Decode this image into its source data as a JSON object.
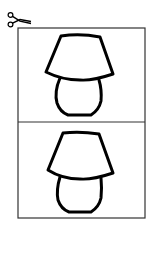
{
  "worksheet": {
    "type": "cut-out card sheet",
    "colors": {
      "line": "#000000",
      "frame": "#333333",
      "background": "#ffffff"
    },
    "scissors_icon": "scissors-icon",
    "cards": [
      {
        "picture": "lamp",
        "position": "top"
      },
      {
        "picture": "lamp",
        "position": "bottom"
      }
    ]
  }
}
